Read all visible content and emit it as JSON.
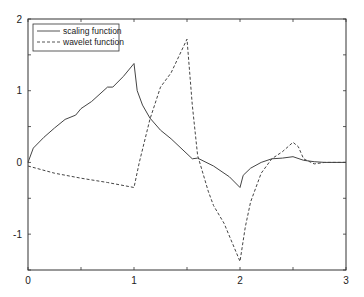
{
  "chart_data": {
    "type": "line",
    "title": "",
    "xlabel": "",
    "ylabel": "",
    "xlim": [
      0,
      3
    ],
    "ylim": [
      -1.5,
      2
    ],
    "x_ticks": [
      0,
      1,
      2,
      3
    ],
    "y_ticks": [
      -1,
      0,
      1,
      2
    ],
    "grid": false,
    "legend_position": "upper left",
    "series": [
      {
        "name": "scaling function",
        "style": "solid",
        "x": [
          0,
          0.05,
          0.15,
          0.25,
          0.35,
          0.45,
          0.5,
          0.6,
          0.75,
          0.8,
          0.9,
          1.0,
          1.03,
          1.08,
          1.15,
          1.25,
          1.35,
          1.5,
          1.55,
          1.6,
          1.75,
          1.9,
          2.0,
          2.03,
          2.1,
          2.2,
          2.3,
          2.4,
          2.5,
          2.6,
          2.7,
          2.8,
          3.0
        ],
        "y": [
          0,
          0.2,
          0.35,
          0.48,
          0.6,
          0.66,
          0.75,
          0.85,
          1.05,
          1.05,
          1.2,
          1.38,
          1.0,
          0.8,
          0.62,
          0.45,
          0.33,
          0.12,
          0.05,
          0.06,
          -0.05,
          -0.2,
          -0.35,
          -0.18,
          -0.08,
          0.0,
          0.05,
          0.06,
          0.08,
          0.03,
          0.01,
          0.0,
          0.0
        ]
      },
      {
        "name": "wavelet function",
        "style": "dashed",
        "x": [
          0,
          0.25,
          0.5,
          0.75,
          1.0,
          1.05,
          1.15,
          1.25,
          1.35,
          1.5,
          1.55,
          1.6,
          1.7,
          1.75,
          1.85,
          2.0,
          2.05,
          2.1,
          2.2,
          2.3,
          2.4,
          2.5,
          2.55,
          2.6,
          2.7,
          2.8,
          3.0
        ],
        "y": [
          -0.05,
          -0.15,
          -0.22,
          -0.28,
          -0.35,
          0.0,
          0.6,
          1.05,
          1.25,
          1.72,
          0.8,
          0.1,
          -0.4,
          -0.6,
          -0.85,
          -1.38,
          -0.9,
          -0.55,
          -0.15,
          0.05,
          0.15,
          0.28,
          0.22,
          0.05,
          -0.02,
          0.0,
          0.0
        ]
      }
    ]
  },
  "axes": {
    "x_tick_labels": [
      "0",
      "1",
      "2",
      "3"
    ],
    "y_tick_labels": [
      "2",
      "1",
      "0",
      "-1"
    ]
  },
  "legend": {
    "items": [
      "scaling function",
      "wavelet function"
    ]
  }
}
